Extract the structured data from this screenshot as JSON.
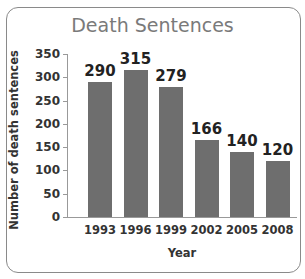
{
  "chart_data": {
    "type": "bar",
    "title": "Death Sentences",
    "xlabel": "Year",
    "ylabel": "Number of death sentences",
    "categories": [
      "1993",
      "1996",
      "1999",
      "2002",
      "2005",
      "2008"
    ],
    "values": [
      290,
      315,
      279,
      166,
      140,
      120
    ],
    "data_labels": [
      "290",
      "315",
      "279",
      "166",
      "140",
      "120"
    ],
    "ylim": [
      0,
      350
    ],
    "yticks": [
      "0",
      "50",
      "100",
      "150",
      "200",
      "250",
      "300",
      "350"
    ],
    "grid": false,
    "legend": null,
    "bar_color": "#6e6e6e"
  }
}
